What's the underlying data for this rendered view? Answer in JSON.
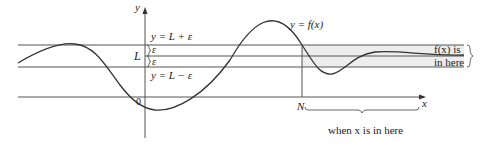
{
  "diagram": {
    "labels": {
      "y_axis": "y",
      "x_axis": "x",
      "origin": "0",
      "L": "L",
      "eps_upper": "ε",
      "eps_lower": "ε",
      "upper_line": "y = L + ε",
      "lower_line": "y = L − ε",
      "curve": "y = f(x)",
      "N": "N",
      "fx_line1": "f(x) is",
      "fx_line2": "in here",
      "x_range": "when x is in here"
    },
    "colors": {
      "line": "#555555",
      "curve": "#333333",
      "band_fill": "#ededed"
    }
  }
}
